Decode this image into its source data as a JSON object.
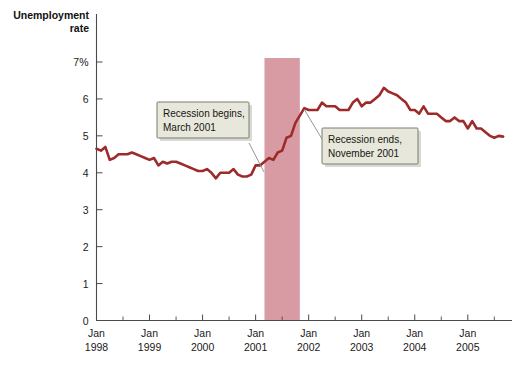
{
  "chart_data": {
    "type": "line",
    "title": "",
    "ylabel": "Unemployment rate",
    "xlabel": "",
    "ylim": [
      0,
      7
    ],
    "y_ticks": [
      0,
      1,
      2,
      3,
      4,
      5,
      6,
      7
    ],
    "y_tick_labels": [
      "0",
      "1",
      "2",
      "3",
      "4",
      "5",
      "6",
      "7%"
    ],
    "x_tick_labels": [
      {
        "month": "Jan",
        "year": "1998"
      },
      {
        "month": "Jan",
        "year": "1999"
      },
      {
        "month": "Jan",
        "year": "2000"
      },
      {
        "month": "Jan",
        "year": "2001"
      },
      {
        "month": "Jan",
        "year": "2002"
      },
      {
        "month": "Jan",
        "year": "2003"
      },
      {
        "month": "Jan",
        "year": "2004"
      },
      {
        "month": "Jan",
        "year": "2005"
      }
    ],
    "x_start": "1998-01",
    "x_end": "2005-09",
    "x_minor_tick_interval_months": 6,
    "grid": false,
    "legend": "none",
    "line_color": "#9e2b2b",
    "series": [
      {
        "name": "Unemployment rate",
        "units": "percent",
        "values": [
          4.65,
          4.6,
          4.7,
          4.35,
          4.4,
          4.5,
          4.5,
          4.5,
          4.55,
          4.5,
          4.45,
          4.4,
          4.35,
          4.4,
          4.2,
          4.3,
          4.25,
          4.3,
          4.3,
          4.25,
          4.2,
          4.15,
          4.1,
          4.05,
          4.05,
          4.1,
          4.0,
          3.85,
          4.0,
          4.0,
          4.0,
          4.1,
          3.95,
          3.9,
          3.9,
          3.95,
          4.2,
          4.2,
          4.3,
          4.4,
          4.35,
          4.55,
          4.6,
          4.95,
          5.0,
          5.35,
          5.55,
          5.75,
          5.7,
          5.7,
          5.7,
          5.9,
          5.8,
          5.8,
          5.8,
          5.7,
          5.7,
          5.7,
          5.9,
          6.0,
          5.8,
          5.9,
          5.9,
          6.0,
          6.1,
          6.3,
          6.2,
          6.15,
          6.1,
          6.0,
          5.9,
          5.7,
          5.7,
          5.6,
          5.8,
          5.6,
          5.6,
          5.6,
          5.5,
          5.4,
          5.4,
          5.5,
          5.4,
          5.4,
          5.2,
          5.4,
          5.2,
          5.2,
          5.1,
          5.0,
          4.95,
          5.0,
          4.98
        ]
      }
    ],
    "shaded_regions": [
      {
        "name": "recession-band",
        "label": "Recession",
        "start": "2001-03",
        "end": "2001-11",
        "color": "#d99ba3"
      }
    ],
    "annotations": [
      {
        "id": "recession-begins",
        "line1": "Recession begins,",
        "line2": "March 2001",
        "points_to": "2001-03"
      },
      {
        "id": "recession-ends",
        "line1": "Recession ends,",
        "line2": "November 2001",
        "points_to": "2001-11"
      }
    ]
  },
  "style": {
    "callout_fill": "#e8e7dc",
    "axis_color": "#4a4a4a"
  }
}
